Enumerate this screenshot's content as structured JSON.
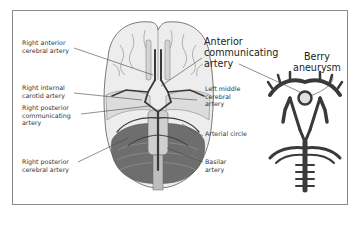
{
  "diagram": {
    "labels": {
      "right_anterior_cerebral_artery": "Right anterior\ncerebral artery",
      "right_internal_carotid_artery": "Right internal\ncarotid artery",
      "right_posterior_communicating_artery": "Right posterior\ncommunicating\nartery",
      "right_posterior_cerebral_artery": "Right posterior\ncerebral artery",
      "anterior_communicating_artery": "Anterior\ncommunicating\nartery",
      "left_middle_cerebral_artery": "Left middle\ncerebral\nartery",
      "arterial_circle": "Arterial circle",
      "basilar_artery": "Basilar\nartery",
      "berry_aneurysm": "Berry\naneurysm"
    },
    "colors": {
      "frame": "#8a8a8a",
      "brain_fill": "#e9e9e9",
      "brain_outline": "#7a7a7a",
      "cerebellum": "#6a6a6a",
      "artery": "#3a3a3a",
      "leader_line": "#444444"
    }
  }
}
